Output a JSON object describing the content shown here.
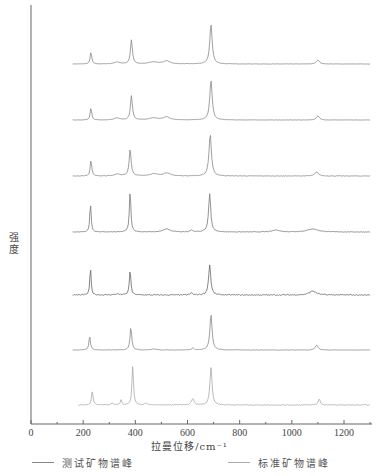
{
  "chart_data": {
    "type": "line",
    "title": "",
    "xlabel": "拉曼位移/cm⁻¹",
    "ylabel": "强度",
    "xlim": [
      0,
      1300
    ],
    "xticks": [
      0,
      200,
      400,
      600,
      800,
      1000,
      1200
    ],
    "yticks": [],
    "grid": false,
    "legend_position": "bottom",
    "legend": [
      {
        "label": "测试矿物谱峰",
        "color": "#888888"
      },
      {
        "label": "标准矿物谱峰",
        "color": "#aaaaaa"
      }
    ],
    "layout_note": "seven vertically offset Raman spectra, x from ~150 to 1300 cm⁻¹, arbitrary intensity units",
    "series": [
      {
        "name": "spectrum-1",
        "offset_px": 64,
        "color": "#888888",
        "noise": 0.3,
        "peaks": [
          [
            230,
            12,
            7
          ],
          [
            385,
            24,
            9
          ],
          [
            690,
            40,
            11
          ],
          [
            1100,
            4,
            14
          ],
          [
            470,
            2,
            40
          ],
          [
            520,
            3,
            30
          ],
          [
            330,
            2,
            25
          ]
        ]
      },
      {
        "name": "spectrum-2",
        "offset_px": 120,
        "color": "#888888",
        "noise": 0.3,
        "peaks": [
          [
            230,
            12,
            7
          ],
          [
            385,
            24,
            9
          ],
          [
            690,
            40,
            11
          ],
          [
            1100,
            4,
            14
          ],
          [
            470,
            2,
            40
          ],
          [
            520,
            3,
            30
          ],
          [
            330,
            2,
            25
          ]
        ]
      },
      {
        "name": "spectrum-3",
        "offset_px": 176,
        "color": "#888888",
        "noise": 0.5,
        "peaks": [
          [
            230,
            16,
            7
          ],
          [
            380,
            27,
            9
          ],
          [
            687,
            42,
            11
          ],
          [
            1095,
            4,
            16
          ],
          [
            470,
            2,
            40
          ],
          [
            520,
            3,
            30
          ],
          [
            330,
            2,
            25
          ]
        ]
      },
      {
        "name": "spectrum-4",
        "offset_px": 232,
        "color": "#777777",
        "noise": 0.5,
        "peaks": [
          [
            228,
            29,
            6
          ],
          [
            380,
            41,
            7
          ],
          [
            685,
            38,
            10
          ],
          [
            1080,
            3,
            50
          ],
          [
            940,
            2,
            30
          ],
          [
            520,
            3,
            30
          ],
          [
            615,
            2,
            12
          ]
        ]
      },
      {
        "name": "spectrum-5",
        "offset_px": 295,
        "color": "#666666",
        "noise": 1.0,
        "peaks": [
          [
            228,
            27,
            6
          ],
          [
            380,
            25,
            7
          ],
          [
            685,
            30,
            10
          ],
          [
            1080,
            4,
            30
          ],
          [
            615,
            2,
            10
          ],
          [
            330,
            1,
            20
          ]
        ]
      },
      {
        "name": "spectrum-6",
        "offset_px": 350,
        "color": "#888888",
        "noise": 0.4,
        "peaks": [
          [
            225,
            14,
            7
          ],
          [
            383,
            23,
            8
          ],
          [
            690,
            36,
            10
          ],
          [
            1095,
            5,
            12
          ],
          [
            620,
            2,
            10
          ],
          [
            470,
            1,
            20
          ]
        ]
      },
      {
        "name": "spectrum-7",
        "offset_px": 405,
        "color": "#aaaaaa",
        "noise": 0.8,
        "peaks": [
          [
            235,
            14,
            7
          ],
          [
            390,
            38,
            7
          ],
          [
            690,
            37,
            10
          ],
          [
            1105,
            6,
            10
          ],
          [
            620,
            6,
            12
          ],
          [
            345,
            5,
            7
          ],
          [
            310,
            2,
            8
          ],
          [
            440,
            2,
            10
          ]
        ],
        "x_start": 180
      }
    ]
  },
  "axes": {
    "x_tick_labels": [
      "0",
      "200",
      "400",
      "600",
      "800",
      "1000",
      "1200"
    ],
    "xlabel": "拉曼位移/cm⁻¹",
    "ylabel": "强度"
  },
  "legend": {
    "items": [
      {
        "label": "测试矿物谱峰"
      },
      {
        "label": "标准矿物谱峰"
      }
    ]
  }
}
